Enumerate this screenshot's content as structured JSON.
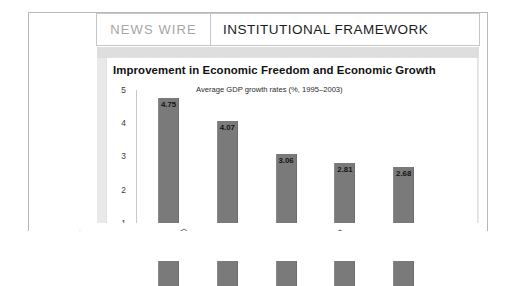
{
  "header": {
    "kicker": "NEWS WIRE",
    "section_title": "INSTITUTIONAL FRAMEWORK"
  },
  "chart_data": {
    "type": "bar",
    "title": "Improvement in Economic Freedom and Economic Growth",
    "subtitle": "Average GDP growth rates (%, 1995–2003)",
    "xlabel": "",
    "ylabel": "",
    "ylim": [
      0,
      5
    ],
    "grid": false,
    "legend": null,
    "yticks": [
      "5",
      "4",
      "3",
      "2",
      "1"
    ],
    "categories": [
      "",
      "",
      "",
      "",
      ""
    ],
    "values": [
      4.75,
      4.07,
      3.06,
      2.81,
      2.68
    ],
    "value_labels": [
      "4.75",
      "4.07",
      "3.06",
      "2.81",
      "2.68"
    ],
    "bar_color": "#7a7a7a"
  },
  "colors": {
    "kicker": "#a6a6a6",
    "title": "#111111",
    "bar": "#7a7a7a",
    "band": "#e9e9e9"
  }
}
